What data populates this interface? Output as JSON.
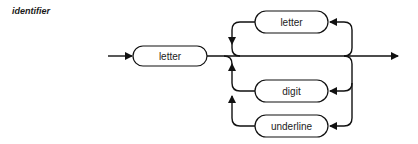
{
  "title": "identifier",
  "diagram": {
    "type": "syntax-diagram",
    "nodes": {
      "entry": "letter",
      "loop_top": "letter",
      "loop_digit": "digit",
      "loop_underline": "underline"
    }
  }
}
